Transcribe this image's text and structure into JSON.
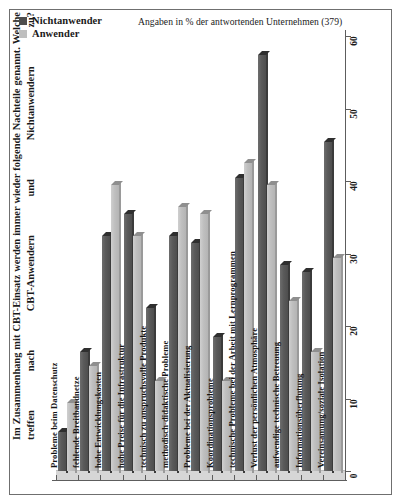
{
  "figure": {
    "question": "Im Zusammenhang mit CBT-Einsatz werden immer wieder folgende Nachteile genannt. Welche treffen nach CBT-Anwendern und Nichtanwendern zu?",
    "note": "Angaben in % der antwortenden Unternehmen (379)"
  },
  "legend": {
    "items": [
      {
        "label": "Nichtanwender",
        "color": "#4e4e4e"
      },
      {
        "label": "Anwender",
        "color": "#bfbfbf"
      }
    ]
  },
  "chart_data": {
    "type": "bar",
    "title": "Im Zusammenhang mit CBT-Einsatz werden immer wieder folgende Nachteile genannt. Welche treffen nach CBT-Anwendern und Nichtanwendern zu?",
    "subtitle": "Angaben in % der antwortenden Unternehmen (379)",
    "orientation": "rotated-column",
    "xlabel": "",
    "ylabel": "",
    "ylim": [
      0,
      60
    ],
    "yticks": [
      0,
      10,
      20,
      30,
      40,
      50,
      60
    ],
    "grid": false,
    "legend_position": "top-left",
    "categories": [
      "Probleme beim Datenschutz",
      "fehlende Breitbandnetze",
      "hohe Entwicklungskosten",
      "hohe Preise für die Infrastruktur",
      "technisch zu anspruchsvolle Produkte",
      "methodisch-didaktische Probleme",
      "Probleme bei der Aktualisierung",
      "Koordinationsprobleme",
      "technische Probleme bei der Arbeit mit Lernprogrammen",
      "Verlust der persönlichen Atmosphäre",
      "aufwendige technische Betreuung",
      "Informationsüberflutung",
      "Vereinsamung/soziale Isolation"
    ],
    "series": [
      {
        "name": "Nichtanwender",
        "color": "#4e4e4e",
        "values": [
          6,
          17,
          33,
          36,
          23,
          33,
          32,
          19,
          41,
          58,
          29,
          28,
          46
        ]
      },
      {
        "name": "Anwender",
        "color": "#bfbfbf",
        "values": [
          10,
          15,
          40,
          33,
          13,
          37,
          36,
          13,
          43,
          40,
          24,
          17,
          30
        ]
      }
    ]
  }
}
